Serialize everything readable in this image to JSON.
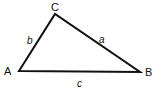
{
  "diagram": {
    "type": "triangle",
    "vertices": [
      {
        "id": "A",
        "label": "A",
        "x": 19,
        "y": 71
      },
      {
        "id": "B",
        "label": "B",
        "x": 140,
        "y": 72
      },
      {
        "id": "C",
        "label": "C",
        "x": 55,
        "y": 14
      }
    ],
    "sides": [
      {
        "id": "a",
        "label": "a",
        "from": "C",
        "to": "B"
      },
      {
        "id": "b",
        "label": "b",
        "from": "A",
        "to": "C"
      },
      {
        "id": "c",
        "label": "c",
        "from": "A",
        "to": "B"
      }
    ],
    "stroke_color": "#111111"
  }
}
